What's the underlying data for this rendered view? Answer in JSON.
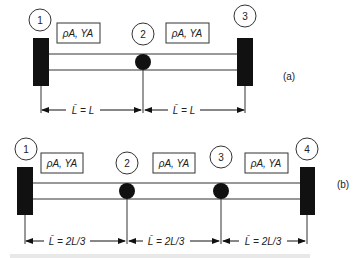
{
  "figure": {
    "a": {
      "panel_label": "(a)",
      "nodes": [
        "1",
        "2",
        "3"
      ],
      "property_labels": [
        "ρA, YA",
        "ρA, YA"
      ],
      "dimensions": [
        "L̄ = L",
        "L̄ = L"
      ]
    },
    "b": {
      "panel_label": "(b)",
      "nodes": [
        "1",
        "2",
        "3",
        "4"
      ],
      "property_labels": [
        "ρA, YA",
        "ρA, YA",
        "ρA, YA"
      ],
      "dimensions": [
        "L̄ = 2L/3",
        "L̄ = 2L/3",
        "L̄ = 2L/3"
      ]
    }
  }
}
